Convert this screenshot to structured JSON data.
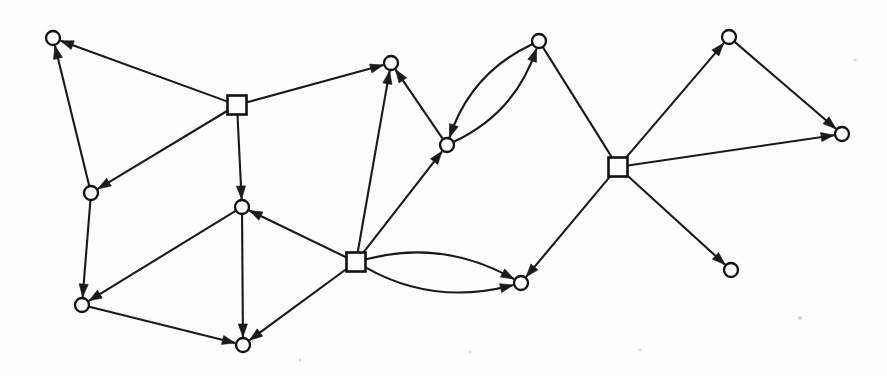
{
  "figure": {
    "width": 887,
    "height": 376,
    "background_color": "#fdfdfb",
    "stroke_color": "#1a1a1a",
    "node_fill_color": "#fdfdfb"
  },
  "graph_data": {
    "type": "directed-graph",
    "node_shapes": [
      "circle",
      "square"
    ],
    "circle_radius": 7,
    "square_size": 19,
    "nodes": [
      {
        "id": "c1",
        "shape": "circle",
        "x": 53,
        "y": 38
      },
      {
        "id": "c2",
        "shape": "circle",
        "x": 91,
        "y": 193
      },
      {
        "id": "c3",
        "shape": "circle",
        "x": 82,
        "y": 305
      },
      {
        "id": "c4",
        "shape": "circle",
        "x": 242,
        "y": 207
      },
      {
        "id": "c5",
        "shape": "circle",
        "x": 243,
        "y": 345
      },
      {
        "id": "c6",
        "shape": "circle",
        "x": 391,
        "y": 63
      },
      {
        "id": "c7",
        "shape": "circle",
        "x": 447,
        "y": 145
      },
      {
        "id": "c8",
        "shape": "circle",
        "x": 539,
        "y": 41
      },
      {
        "id": "c9",
        "shape": "circle",
        "x": 521,
        "y": 283
      },
      {
        "id": "c10",
        "shape": "circle",
        "x": 729,
        "y": 37
      },
      {
        "id": "c11",
        "shape": "circle",
        "x": 842,
        "y": 134
      },
      {
        "id": "c12",
        "shape": "circle",
        "x": 731,
        "y": 270
      },
      {
        "id": "s1",
        "shape": "square",
        "x": 237,
        "y": 105
      },
      {
        "id": "s2",
        "shape": "square",
        "x": 356,
        "y": 262
      },
      {
        "id": "s3",
        "shape": "square",
        "x": 618,
        "y": 167
      }
    ],
    "edges": [
      {
        "from": "s1",
        "to": "c1",
        "curve": 0,
        "arrow": "end"
      },
      {
        "from": "c2",
        "to": "c1",
        "curve": 0,
        "arrow": "end"
      },
      {
        "from": "s1",
        "to": "c2",
        "curve": 0,
        "arrow": "end"
      },
      {
        "from": "s1",
        "to": "c4",
        "curve": 0,
        "arrow": "end"
      },
      {
        "from": "s1",
        "to": "c6",
        "curve": 0,
        "arrow": "end"
      },
      {
        "from": "c2",
        "to": "c3",
        "curve": 0,
        "arrow": "end"
      },
      {
        "from": "c4",
        "to": "c3",
        "curve": 0,
        "arrow": "end"
      },
      {
        "from": "c4",
        "to": "c5",
        "curve": 0,
        "arrow": "end"
      },
      {
        "from": "c3",
        "to": "c5",
        "curve": 0,
        "arrow": "end"
      },
      {
        "from": "s2",
        "to": "c4",
        "curve": 0,
        "arrow": "end"
      },
      {
        "from": "s2",
        "to": "c5",
        "curve": 0,
        "arrow": "end"
      },
      {
        "from": "s2",
        "to": "c6",
        "curve": 0,
        "arrow": "end"
      },
      {
        "from": "s2",
        "to": "c7",
        "curve": 0,
        "arrow": "end"
      },
      {
        "from": "c7",
        "to": "c6",
        "curve": 0,
        "arrow": "end"
      },
      {
        "from": "c7",
        "to": "c8",
        "curve": 30,
        "arrow": "end"
      },
      {
        "from": "c8",
        "to": "c7",
        "curve": 30,
        "arrow": "end"
      },
      {
        "from": "c8",
        "to": "s3",
        "curve": 0,
        "arrow": "none"
      },
      {
        "from": "s2",
        "to": "c9",
        "curve": 34,
        "arrow": "end"
      },
      {
        "from": "s2",
        "to": "c9",
        "curve": -34,
        "arrow": "end"
      },
      {
        "from": "s3",
        "to": "c9",
        "curve": 0,
        "arrow": "end"
      },
      {
        "from": "s3",
        "to": "c10",
        "curve": 0,
        "arrow": "end"
      },
      {
        "from": "c10",
        "to": "c11",
        "curve": 0,
        "arrow": "end"
      },
      {
        "from": "s3",
        "to": "c11",
        "curve": 0,
        "arrow": "end"
      },
      {
        "from": "s3",
        "to": "c12",
        "curve": 0,
        "arrow": "end"
      }
    ],
    "counts": {
      "circle_nodes": 12,
      "square_nodes": 3,
      "edges": 24
    }
  }
}
